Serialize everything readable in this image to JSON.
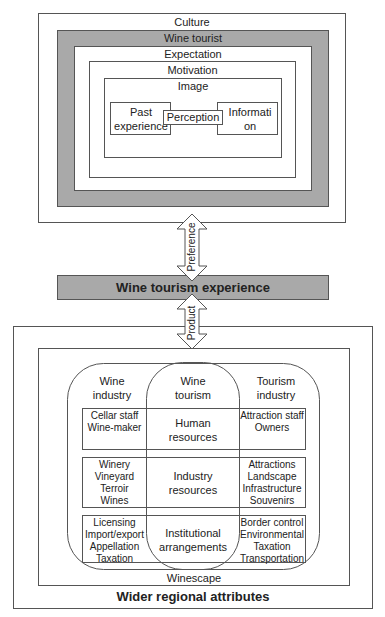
{
  "top_block": {
    "culture_label": "Culture",
    "wine_tourist_label": "Wine tourist",
    "expectation_label": "Expectation",
    "motivation_label": "Motivation",
    "image_label": "Image",
    "past_experience_label": "Past experience",
    "perception_label": "Perception",
    "information_label": "Information"
  },
  "arrows": {
    "preference_label": "Preference",
    "product_label": "Product"
  },
  "center_bar": {
    "label": "Wine tourism experience"
  },
  "bottom_block": {
    "outer_label": "Wider regional attributes",
    "winescape_label": "Winescape",
    "columns": [
      {
        "line1": "Wine",
        "line2": "industry"
      },
      {
        "line1": "Wine",
        "line2": "tourism"
      },
      {
        "line1": "Tourism",
        "line2": "industry"
      }
    ],
    "rows": [
      {
        "left": [
          "Cellar staff",
          "Wine-maker"
        ],
        "center": [
          "Human",
          "resources"
        ],
        "right": [
          "Attraction staff",
          "Owners"
        ]
      },
      {
        "left": [
          "Winery",
          "Vineyard",
          "Terroir",
          "Wines"
        ],
        "center": [
          "Industry",
          "resources"
        ],
        "right": [
          "Attractions",
          "Landscape",
          "Infrastructure",
          "Souvenirs"
        ]
      },
      {
        "left": [
          "Licensing",
          "Import/export",
          "Appellation",
          "Taxation"
        ],
        "center": [
          "Institutional",
          "arrangements"
        ],
        "right": [
          "Border control",
          "Environmental",
          "Taxation",
          "Transportation"
        ]
      }
    ]
  },
  "colors": {
    "gray_fill": "#a9a9a9",
    "line": "#555555"
  }
}
